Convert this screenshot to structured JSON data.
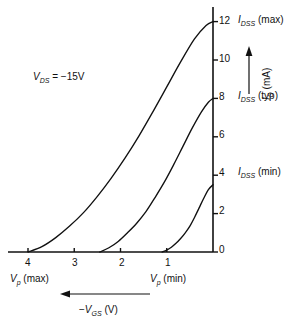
{
  "chart_data": {
    "type": "line",
    "title": "",
    "xlabel": "-V_GS (V)",
    "ylabel": "I_D (mA)",
    "xlim": [
      4.4,
      -0.2
    ],
    "ylim": [
      0,
      13
    ],
    "x_ticks": [
      4,
      3,
      2,
      1,
      0
    ],
    "y_ticks": [
      0,
      2,
      4,
      6,
      8,
      10,
      12
    ],
    "grid": false,
    "legend": "none",
    "x_axis_direction": "right-to-left (negative gate voltage increases leftward)",
    "annotations": [
      {
        "text": "V_DS = -15V",
        "x": 3.45,
        "y": 9.3
      },
      {
        "text": "V_p (max)",
        "x": 4.0,
        "y": -1.55
      },
      {
        "text": "V_p (min)",
        "x": 1.0,
        "y": -1.55
      },
      {
        "text": "I_DSS (max)",
        "x": -0.4,
        "y": 12.0
      },
      {
        "text": "I_DSS (typ)",
        "x": -0.4,
        "y": 8.0
      },
      {
        "text": "I_DSS (min)",
        "x": -0.4,
        "y": 4.0
      }
    ],
    "series": [
      {
        "name": "I_DSS (max)",
        "pinchoff_v": 4.0,
        "idss_ma": 12.0,
        "points": [
          [
            4.0,
            0
          ],
          [
            3.7,
            0.28
          ],
          [
            3.4,
            0.75
          ],
          [
            3.1,
            1.35
          ],
          [
            2.8,
            2.05
          ],
          [
            2.5,
            2.9
          ],
          [
            2.2,
            3.85
          ],
          [
            1.9,
            4.9
          ],
          [
            1.6,
            6.05
          ],
          [
            1.3,
            7.3
          ],
          [
            1.0,
            8.6
          ],
          [
            0.7,
            9.9
          ],
          [
            0.4,
            11.1
          ],
          [
            0.15,
            11.8
          ],
          [
            0.0,
            12.0
          ]
        ]
      },
      {
        "name": "I_DSS (typ)",
        "pinchoff_v": 2.45,
        "idss_ma": 8.0,
        "points": [
          [
            2.45,
            0
          ],
          [
            2.25,
            0.22
          ],
          [
            2.05,
            0.55
          ],
          [
            1.85,
            1.0
          ],
          [
            1.65,
            1.5
          ],
          [
            1.45,
            2.1
          ],
          [
            1.25,
            2.85
          ],
          [
            1.05,
            3.65
          ],
          [
            0.85,
            4.55
          ],
          [
            0.65,
            5.5
          ],
          [
            0.45,
            6.45
          ],
          [
            0.25,
            7.3
          ],
          [
            0.1,
            7.8
          ],
          [
            0.0,
            8.0
          ]
        ]
      },
      {
        "name": "I_DSS (min)",
        "pinchoff_v": 1.1,
        "idss_ma": 3.5,
        "points": [
          [
            1.1,
            0
          ],
          [
            1.0,
            0.1
          ],
          [
            0.9,
            0.25
          ],
          [
            0.8,
            0.45
          ],
          [
            0.7,
            0.7
          ],
          [
            0.6,
            1.0
          ],
          [
            0.5,
            1.35
          ],
          [
            0.4,
            1.8
          ],
          [
            0.3,
            2.3
          ],
          [
            0.2,
            2.8
          ],
          [
            0.1,
            3.25
          ],
          [
            0.0,
            3.5
          ]
        ]
      }
    ]
  },
  "axes": {
    "x_tick_labels": [
      "4",
      "3",
      "2",
      "1",
      "0"
    ],
    "y_tick_labels": [
      "0",
      "2",
      "4",
      "6",
      "8",
      "10",
      "12"
    ],
    "x_axis_label_main": "V",
    "x_axis_label_sub": "GS",
    "x_axis_label_unit": "(V)",
    "x_axis_label_sign": "−",
    "y_axis_label_main": "I",
    "y_axis_label_sub": "D",
    "y_axis_label_unit": "(mA)"
  },
  "labels": {
    "vds": {
      "main": "V",
      "sub": "DS",
      "rest": " = −15V"
    },
    "vp_max": {
      "main": "V",
      "sub": "p",
      "rest": " (max)"
    },
    "vp_min": {
      "main": "V",
      "sub": "p",
      "rest": " (min)"
    },
    "idss_max": {
      "main": "I",
      "sub": "DSS",
      "rest": " (max)"
    },
    "idss_typ": {
      "main": "I",
      "sub": "DSS",
      "rest": " (typ)"
    },
    "idss_min": {
      "main": "I",
      "sub": "DSS",
      "rest": " (min)"
    }
  },
  "colors": {
    "ink": "#111111",
    "background": "#ffffff"
  }
}
